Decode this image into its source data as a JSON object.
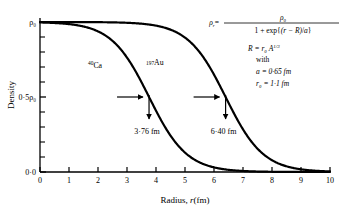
{
  "chart_data": {
    "type": "line",
    "title": "",
    "xlabel": "Radius, r(fm)",
    "ylabel": "Density",
    "xlim": [
      0,
      10
    ],
    "ylim": [
      0,
      1.08
    ],
    "grid": false,
    "legend": "inline-curve-labels",
    "x_ticks": [
      "0",
      "1",
      "2",
      "3",
      "4",
      "5",
      "6",
      "7",
      "8",
      "9",
      "10"
    ],
    "y_tick_labels": [
      {
        "value": 0.0,
        "label": "0·0"
      },
      {
        "value": 0.5,
        "label": "0·5ρ₀"
      },
      {
        "value": 1.0,
        "label": "ρ₀"
      }
    ],
    "y_minor_tick_values": [
      0.1,
      0.2,
      0.3,
      0.4,
      0.6,
      0.7,
      0.8,
      0.9
    ],
    "model": "Woods-Saxon: rho(r) = rho0 / (1 + exp((r - R)/a))",
    "series": [
      {
        "name": "⁴⁰Ca",
        "nuclide_label_mass": "40",
        "nuclide_label_symbol": "Ca",
        "half_density_radius": 3.76,
        "half_density_radius_label": "3·76 fm",
        "diffuseness_a": 0.65
      },
      {
        "name": "¹⁹⁷Au",
        "nuclide_label_mass": "197",
        "nuclide_label_symbol": "Au",
        "half_density_radius": 6.4,
        "half_density_radius_label": "6·40 fm",
        "diffuseness_a": 0.65
      }
    ]
  },
  "equation": {
    "lhs": "ρ",
    "lhs_sub": "r",
    "equals": "=",
    "numerator": "ρ₀",
    "denominator_pre": "1 + exp",
    "denominator_brace_open": "{",
    "denominator_expr": "(r − R)",
    "denominator_div": "/",
    "denominator_a": "a",
    "denominator_brace_close": "}",
    "line_R": "R = r₀ A",
    "line_R_exp": "1/3",
    "line_with": "with",
    "line_a": "a = 0·65 fm",
    "line_r0": "r₀ = 1·1 fm"
  },
  "annotations": {
    "ca_value": "3·76 fm",
    "au_value": "6·40 fm",
    "ca_curve_label_mass": "40",
    "ca_curve_label_symbol": "Ca",
    "au_curve_label_mass": "197",
    "au_curve_label_symbol": "Au"
  },
  "axes": {
    "y_label": "Density",
    "x_label_prefix": "Radius, ",
    "x_label_var": "r",
    "x_label_unit": "(fm)",
    "y_top_label": "ρ₀",
    "y_mid_label": "0·5ρ₀",
    "y_bottom_label": "0·0"
  },
  "colors": {
    "ink": "#000000",
    "background": "#ffffff",
    "axis": "#000000"
  }
}
